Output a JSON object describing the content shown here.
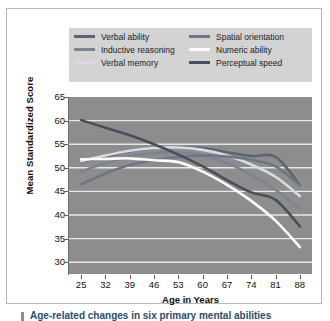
{
  "figure": {
    "background": "#ffffff",
    "panel_border": "#b9b9b9"
  },
  "legend": {
    "background": "#d3d3d3",
    "items": [
      {
        "label": "Verbal ability",
        "color": "#5b6470",
        "column": "left",
        "swatch": "line-swatch"
      },
      {
        "label": "Inductive reasoning",
        "color": "#7b8490",
        "column": "left",
        "swatch": "line-swatch"
      },
      {
        "label": "Verbal memory",
        "color": "#d8dce2",
        "column": "left",
        "swatch": "line-swatch"
      },
      {
        "label": "Spatial orientation",
        "color": "#6d7682",
        "column": "right",
        "swatch": "line-swatch"
      },
      {
        "label": "Numeric ability",
        "color": "#fbfbfb",
        "column": "right",
        "swatch": "line-swatch"
      },
      {
        "label": "Perceptual speed",
        "color": "#474f5a",
        "column": "right",
        "swatch": "line-swatch"
      }
    ]
  },
  "axes": {
    "plot_background": "#8d8d8d",
    "gridline_color": "#e8e8e8",
    "ylabel": "Mean Standardized Score",
    "xlabel": "Age in Years",
    "yticks": [
      30,
      35,
      40,
      45,
      50,
      55,
      60,
      65
    ],
    "xticks": [
      25,
      32,
      39,
      46,
      53,
      60,
      67,
      74,
      81,
      88
    ]
  },
  "caption": {
    "text": "Age-related changes in six primary mental abilities",
    "accent": "#8a8f96"
  },
  "chart_data": {
    "type": "line",
    "xlabel": "Age in Years",
    "ylabel": "Mean Standardized Score",
    "xlim": [
      21.5,
      91.5
    ],
    "ylim": [
      27.5,
      65
    ],
    "grid": true,
    "grid_axis": "y",
    "legend_position": "above-plot",
    "x": [
      25,
      32,
      39,
      46,
      53,
      60,
      67,
      74,
      81,
      88
    ],
    "series": [
      {
        "name": "Verbal ability",
        "color": "#5b6470",
        "values": [
          51.3,
          52.4,
          53.5,
          54.2,
          54.3,
          54.2,
          53.3,
          52.5,
          52.3,
          46.4
        ]
      },
      {
        "name": "Inductive reasoning",
        "color": "#7b8490",
        "values": [
          49.2,
          51.0,
          52.4,
          53.1,
          53.3,
          52.6,
          51.0,
          48.5,
          45.3,
          41.2
        ]
      },
      {
        "name": "Verbal memory",
        "color": "#d8dce2",
        "values": [
          51.4,
          52.6,
          53.6,
          54.2,
          54.3,
          53.8,
          52.6,
          50.7,
          48.1,
          44.0
        ]
      },
      {
        "name": "Spatial orientation",
        "color": "#6d7682",
        "values": [
          46.5,
          48.8,
          50.6,
          51.6,
          52.3,
          52.6,
          52.4,
          51.7,
          50.3,
          46.3
        ]
      },
      {
        "name": "Numeric ability",
        "color": "#fbfbfb",
        "values": [
          51.8,
          51.9,
          52.0,
          51.6,
          51.2,
          49.2,
          46.4,
          43.0,
          38.8,
          33.2
        ]
      },
      {
        "name": "Perceptual speed",
        "color": "#474f5a",
        "values": [
          60.1,
          58.5,
          56.9,
          55.0,
          52.8,
          50.3,
          47.4,
          44.8,
          43.2,
          37.6
        ]
      }
    ]
  }
}
